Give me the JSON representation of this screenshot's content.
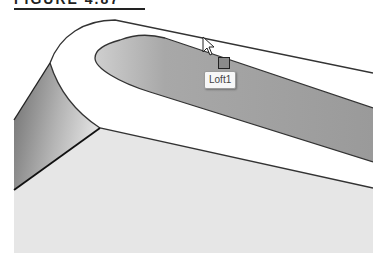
{
  "figure": {
    "title": "FIGURE 4.87"
  },
  "viewport": {
    "tooltip_label": "Loft1",
    "colors": {
      "floor": "#e6e6e6",
      "side_face_dark": "#7a7a7a",
      "side_face_light": "#d8d8d8",
      "pocket": "#9c9c9c",
      "top_face": "#ffffff",
      "edge": "#222222"
    }
  }
}
